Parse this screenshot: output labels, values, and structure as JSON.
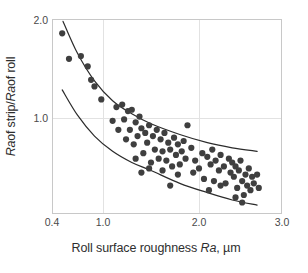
{
  "figure": {
    "title": "",
    "background_color": "#ffffff",
    "frame_color": "#c8c8c8",
    "grid_color": "#e2e2e2",
    "marker_color": "#3f3f3f",
    "envelope_color": "#2b2b2b"
  },
  "axes": {
    "x_label_parts": {
      "pre": "Roll surface roughness ",
      "italic": "Ra",
      "post": ", µm"
    },
    "x_label_text": "Roll surface roughness Ra, µm",
    "y_label_parts": {
      "a_italic": "Ra",
      "a_post": " of strip/ ",
      "b_italic": "Ra",
      "b_post": " of roll"
    },
    "y_label_text": "Ra of strip/ Ra of roll",
    "x_ticks": [
      {
        "label": "0.4",
        "px": 52
      },
      {
        "label": "1.0",
        "px": 103
      },
      {
        "label": "2.0",
        "px": 199
      },
      {
        "label": "3.0",
        "px": 282
      }
    ],
    "y_ticks": [
      {
        "label": "2.0",
        "px": 20
      },
      {
        "label": "1.0",
        "px": 118
      }
    ],
    "xlim": [
      0.4,
      3.0
    ],
    "ylim": [
      0.48,
      2.0
    ],
    "grid": true,
    "legend": "none"
  },
  "chart_data": {
    "type": "scatter",
    "title": "",
    "xlabel": "Roll surface roughness Ra, µm",
    "ylabel": "Ra of strip/ Ra of roll",
    "xlim": [
      0.4,
      3.0
    ],
    "ylim": [
      0.48,
      2.0
    ],
    "grid": true,
    "legend": "none",
    "xticks": [
      0.4,
      1.0,
      2.0,
      3.0
    ],
    "yticks": [
      1.0,
      2.0
    ],
    "series": [
      {
        "name": "Measured data",
        "marker": "filled-circle",
        "color": "#3f3f3f",
        "points": [
          [
            0.52,
            1.82
          ],
          [
            0.6,
            1.52
          ],
          [
            0.74,
            1.55
          ],
          [
            0.82,
            1.44
          ],
          [
            0.86,
            1.31
          ],
          [
            0.9,
            1.25
          ],
          [
            0.98,
            1.14
          ],
          [
            1.1,
            0.98
          ],
          [
            1.14,
            1.08
          ],
          [
            1.16,
            0.92
          ],
          [
            1.2,
            1.1
          ],
          [
            1.22,
            0.99
          ],
          [
            1.24,
            0.86
          ],
          [
            1.26,
            1.05
          ],
          [
            1.28,
            0.92
          ],
          [
            1.3,
            1.06
          ],
          [
            1.32,
            0.83
          ],
          [
            1.34,
            0.97
          ],
          [
            1.36,
            0.88
          ],
          [
            1.38,
            1.01
          ],
          [
            1.4,
            0.93
          ],
          [
            1.42,
            0.78
          ],
          [
            1.44,
            0.9
          ],
          [
            1.46,
            0.84
          ],
          [
            1.48,
            0.95
          ],
          [
            1.5,
            0.73
          ],
          [
            1.52,
            0.88
          ],
          [
            1.54,
            0.8
          ],
          [
            1.56,
            0.92
          ],
          [
            1.58,
            0.75
          ],
          [
            1.6,
            0.86
          ],
          [
            1.62,
            0.79
          ],
          [
            1.64,
            0.9
          ],
          [
            1.66,
            0.74
          ],
          [
            1.68,
            0.84
          ],
          [
            1.7,
            0.8
          ],
          [
            1.72,
            0.71
          ],
          [
            1.74,
            0.87
          ],
          [
            1.76,
            0.77
          ],
          [
            1.78,
            0.83
          ],
          [
            1.8,
            0.72
          ],
          [
            1.82,
            0.79
          ],
          [
            1.84,
            0.85
          ],
          [
            1.86,
            0.75
          ],
          [
            1.88,
            0.95
          ],
          [
            1.7,
            0.62
          ],
          [
            1.78,
            0.67
          ],
          [
            1.92,
            0.81
          ],
          [
            1.96,
            0.74
          ],
          [
            2.0,
            0.7
          ],
          [
            2.04,
            0.78
          ],
          [
            2.06,
            0.65
          ],
          [
            2.1,
            0.76
          ],
          [
            2.14,
            0.72
          ],
          [
            2.16,
            0.8
          ],
          [
            2.18,
            0.64
          ],
          [
            2.2,
            0.74
          ],
          [
            2.24,
            0.69
          ],
          [
            2.26,
            0.77
          ],
          [
            2.3,
            0.71
          ],
          [
            2.32,
            0.63
          ],
          [
            2.36,
            0.75
          ],
          [
            2.38,
            0.68
          ],
          [
            2.4,
            0.73
          ],
          [
            2.42,
            0.66
          ],
          [
            2.44,
            0.71
          ],
          [
            2.46,
            0.61
          ],
          [
            2.48,
            0.69
          ],
          [
            2.5,
            0.74
          ],
          [
            2.52,
            0.64
          ],
          [
            2.54,
            0.58
          ],
          [
            2.56,
            0.67
          ],
          [
            2.58,
            0.62
          ],
          [
            2.6,
            0.7
          ],
          [
            2.62,
            0.6
          ],
          [
            2.64,
            0.66
          ],
          [
            2.66,
            0.63
          ],
          [
            2.7,
            0.67
          ],
          [
            2.72,
            0.61
          ],
          [
            2.44,
            0.57
          ],
          [
            2.52,
            0.55
          ],
          [
            2.12,
            0.6
          ],
          [
            2.26,
            0.62
          ],
          [
            1.94,
            0.68
          ],
          [
            1.4,
            0.68
          ],
          [
            1.48,
            0.7
          ],
          [
            1.62,
            0.69
          ],
          [
            1.34,
            0.75
          ]
        ]
      }
    ],
    "envelopes": [
      {
        "name": "upper-bound-curve",
        "color": "#2b2b2b",
        "points": [
          [
            0.53,
            1.98
          ],
          [
            0.7,
            1.58
          ],
          [
            0.9,
            1.3
          ],
          [
            1.1,
            1.13
          ],
          [
            1.3,
            1.03
          ],
          [
            1.5,
            0.96
          ],
          [
            1.8,
            0.89
          ],
          [
            2.1,
            0.84
          ],
          [
            2.4,
            0.81
          ],
          [
            2.7,
            0.79
          ]
        ]
      },
      {
        "name": "lower-bound-curve",
        "color": "#2b2b2b",
        "points": [
          [
            0.52,
            1.22
          ],
          [
            0.7,
            1.02
          ],
          [
            0.9,
            0.88
          ],
          [
            1.1,
            0.79
          ],
          [
            1.3,
            0.73
          ],
          [
            1.5,
            0.69
          ],
          [
            1.8,
            0.63
          ],
          [
            2.1,
            0.59
          ],
          [
            2.4,
            0.56
          ],
          [
            2.7,
            0.54
          ]
        ]
      }
    ]
  }
}
